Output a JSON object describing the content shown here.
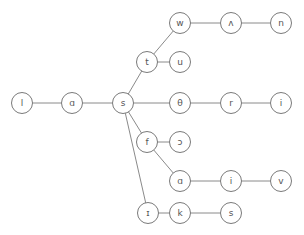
{
  "diagram": {
    "type": "phonetic-trie",
    "nodes": [
      {
        "id": "n0",
        "label": "l",
        "x": 22,
        "y": 103
      },
      {
        "id": "n1",
        "label": "ɑ",
        "x": 72,
        "y": 103
      },
      {
        "id": "n2",
        "label": "s",
        "x": 123,
        "y": 103
      },
      {
        "id": "n3",
        "label": "t",
        "x": 147,
        "y": 62
      },
      {
        "id": "n4",
        "label": "w",
        "x": 180,
        "y": 23
      },
      {
        "id": "n5",
        "label": "ʌ",
        "x": 231,
        "y": 23
      },
      {
        "id": "n6",
        "label": "n",
        "x": 281,
        "y": 23
      },
      {
        "id": "n7",
        "label": "u",
        "x": 180,
        "y": 62
      },
      {
        "id": "n8",
        "label": "θ",
        "x": 180,
        "y": 103
      },
      {
        "id": "n9",
        "label": "r",
        "x": 231,
        "y": 103
      },
      {
        "id": "n10",
        "label": "i",
        "x": 281,
        "y": 103
      },
      {
        "id": "n11",
        "label": "f",
        "x": 147,
        "y": 142
      },
      {
        "id": "n12",
        "label": "ɔ",
        "x": 180,
        "y": 142
      },
      {
        "id": "n13",
        "label": "ɑ",
        "x": 180,
        "y": 181
      },
      {
        "id": "n14",
        "label": "i",
        "x": 231,
        "y": 181
      },
      {
        "id": "n15",
        "label": "v",
        "x": 281,
        "y": 181
      },
      {
        "id": "n16",
        "label": "ɪ",
        "x": 148,
        "y": 213
      },
      {
        "id": "n17",
        "label": "k",
        "x": 180,
        "y": 213
      },
      {
        "id": "n18",
        "label": "s",
        "x": 231,
        "y": 213
      }
    ],
    "edges": [
      [
        "n0",
        "n1"
      ],
      [
        "n1",
        "n2"
      ],
      [
        "n2",
        "n3"
      ],
      [
        "n3",
        "n4"
      ],
      [
        "n4",
        "n5"
      ],
      [
        "n5",
        "n6"
      ],
      [
        "n3",
        "n7"
      ],
      [
        "n2",
        "n8"
      ],
      [
        "n8",
        "n9"
      ],
      [
        "n9",
        "n10"
      ],
      [
        "n2",
        "n11"
      ],
      [
        "n11",
        "n12"
      ],
      [
        "n11",
        "n13"
      ],
      [
        "n13",
        "n14"
      ],
      [
        "n14",
        "n15"
      ],
      [
        "n2",
        "n16"
      ],
      [
        "n16",
        "n17"
      ],
      [
        "n17",
        "n18"
      ]
    ]
  }
}
